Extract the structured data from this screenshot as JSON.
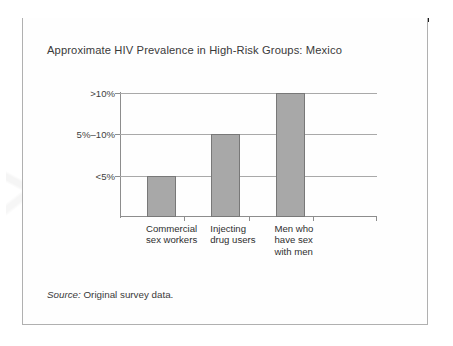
{
  "figure": {
    "title": "Approximate HIV Prevalence in High-Risk Groups: Mexico",
    "source_label": "Source:",
    "source_text": "Original survey data."
  },
  "chart_data": {
    "type": "bar",
    "title": "Approximate HIV Prevalence in High-Risk Groups: Mexico",
    "xlabel": "",
    "ylabel": "",
    "categories": [
      "Commercial\nsex workers",
      "Injecting\ndrug users",
      "Men who\nhave sex\nwith men"
    ],
    "values": [
      1,
      2,
      3
    ],
    "value_labels": [
      "<5%",
      "5%–10%",
      ">10%"
    ],
    "ytick_labels": [
      "<5%",
      "5%–10%",
      ">10%"
    ],
    "ytick_levels": [
      1,
      2,
      3
    ],
    "ylim": [
      0,
      3
    ],
    "grid": true,
    "legend": "none",
    "bar_color": "#a8a8a8",
    "bar_edge_color": "#787878",
    "axis_color": "#8d8d8d",
    "grid_color": "#a9a9a9"
  }
}
